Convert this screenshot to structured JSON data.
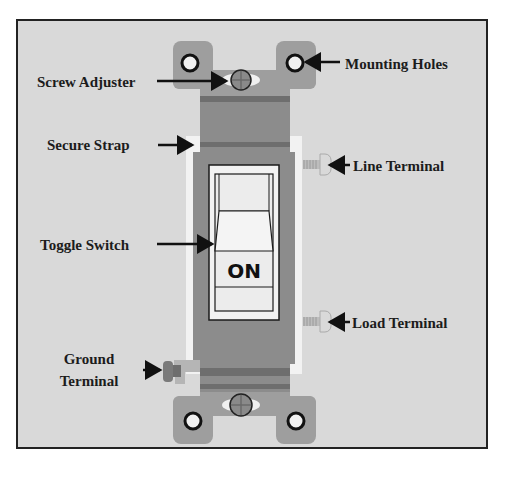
{
  "diagram": {
    "labels": {
      "screw_adjuster": "Screw Adjuster",
      "mounting_holes": "Mounting Holes",
      "secure_strap": "Secure Strap",
      "line_terminal": "Line Terminal",
      "toggle_switch": "Toggle Switch",
      "load_terminal": "Load Terminal",
      "ground_terminal_line1": "Ground",
      "ground_terminal_line2": "Terminal"
    },
    "switch_state_text": "ON",
    "colors": {
      "background": "#d9d9d9",
      "frame_border": "#222222",
      "strap": "#9e9e9e",
      "strap_dark_band": "#6e6e6e",
      "body": "#8c8c8c",
      "white_trim": "#f2f2f2",
      "toggle": "#f0f0f0",
      "outline": "#1a1a1a",
      "ground_screw": "#7a7a7a"
    }
  }
}
